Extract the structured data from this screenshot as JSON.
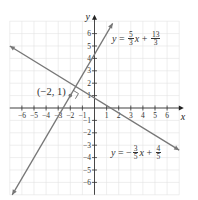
{
  "chart_data": {
    "type": "line",
    "title": "",
    "xlabel": "x",
    "ylabel": "y",
    "xlim": [
      -7,
      7
    ],
    "ylim": [
      -7,
      7
    ],
    "grid": true,
    "x_ticks": [
      -6,
      -5,
      -4,
      -3,
      -2,
      -1,
      1,
      2,
      3,
      4,
      5,
      6
    ],
    "y_ticks": [
      -6,
      -5,
      -4,
      -3,
      -2,
      -1,
      1,
      2,
      3,
      4,
      5,
      6
    ],
    "x_tick_labels": [
      "−6",
      "−5",
      "−4",
      "−3",
      "−2",
      "−1",
      "1",
      "2",
      "3",
      "4",
      "5",
      "6"
    ],
    "y_tick_labels": [
      "−6",
      "−5",
      "−4",
      "−3",
      "−2",
      "−1",
      "1",
      "2",
      "3",
      "4",
      "5",
      "6"
    ],
    "series": [
      {
        "name": "y = 5/3 x + 13/3",
        "slope": 1.6667,
        "intercept": 4.3333,
        "x": [
          -6.8,
          1.5
        ],
        "y": [
          -7.0,
          6.83
        ],
        "color": "#777777"
      },
      {
        "name": "y = -3/5 x + 4/5",
        "slope": -0.6,
        "intercept": 0.8,
        "x": [
          -7.0,
          7.0
        ],
        "y": [
          5.0,
          -3.4
        ],
        "color": "#777777"
      }
    ],
    "annotations": [
      {
        "text": "(−2, 1)",
        "x": -2,
        "y": 1,
        "type": "point-label"
      },
      {
        "text": "right-angle marker",
        "x": -2,
        "y": 1,
        "type": "perpendicular-marker"
      }
    ]
  },
  "labels": {
    "x_axis": "x",
    "y_axis": "y",
    "point": "(−2, 1)",
    "eq1": {
      "lhs": "y",
      "eq": "=",
      "num1": "5",
      "den1": "3",
      "var": "x",
      "plus": "+",
      "num2": "13",
      "den2": "3"
    },
    "eq2": {
      "lhs": "y",
      "eq": "= −",
      "num1": "3",
      "den1": "5",
      "var": "x",
      "plus": "+",
      "num2": "4",
      "den2": "5"
    }
  }
}
